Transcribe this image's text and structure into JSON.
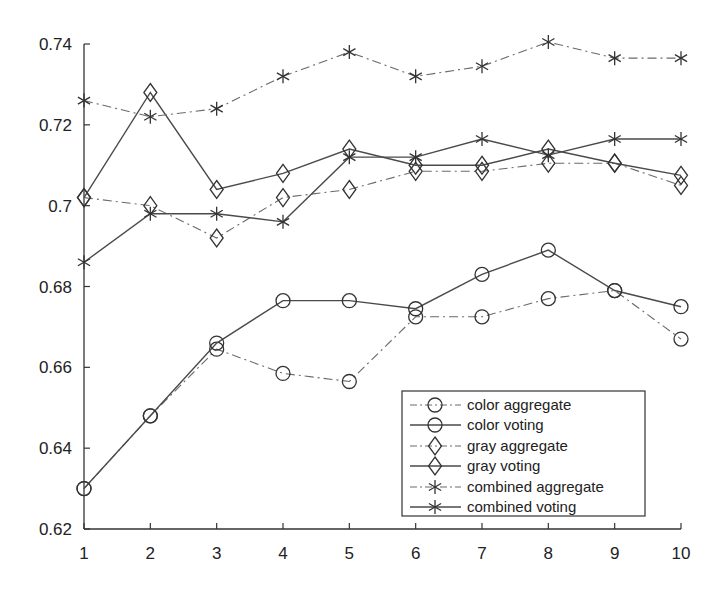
{
  "chart_data": {
    "type": "line",
    "title": "",
    "xlabel": "",
    "ylabel": "",
    "x": [
      1,
      2,
      3,
      4,
      5,
      6,
      7,
      8,
      9,
      10
    ],
    "xlim": [
      1,
      10
    ],
    "ylim": [
      0.62,
      0.74
    ],
    "xticks": [
      "1",
      "2",
      "3",
      "4",
      "5",
      "6",
      "7",
      "8",
      "9",
      "10"
    ],
    "yticks": [
      "0.62",
      "0.64",
      "0.66",
      "0.68",
      "0.7",
      "0.72",
      "0.74"
    ],
    "grid": false,
    "legend_position": "lower right",
    "series": [
      {
        "name": "color aggregate",
        "linestyle": "dash-dot",
        "marker": "circle",
        "values": [
          0.63,
          0.648,
          0.6645,
          0.6585,
          0.6565,
          0.6725,
          0.6725,
          0.677,
          0.679,
          0.667
        ]
      },
      {
        "name": "color voting",
        "linestyle": "solid",
        "marker": "circle",
        "values": [
          0.63,
          0.648,
          0.666,
          0.6765,
          0.6765,
          0.6745,
          0.683,
          0.689,
          0.679,
          0.675
        ]
      },
      {
        "name": "gray aggregate",
        "linestyle": "dash-dot",
        "marker": "diamond",
        "values": [
          0.702,
          0.7,
          0.692,
          0.702,
          0.704,
          0.7085,
          0.7085,
          0.7105,
          0.7105,
          0.705
        ]
      },
      {
        "name": "gray voting",
        "linestyle": "solid",
        "marker": "diamond",
        "values": [
          0.702,
          0.728,
          0.704,
          0.708,
          0.714,
          0.71,
          0.71,
          0.714,
          0.7105,
          0.7075
        ]
      },
      {
        "name": "combined aggregate",
        "linestyle": "dash-dot",
        "marker": "asterisk",
        "values": [
          0.726,
          0.722,
          0.724,
          0.732,
          0.738,
          0.732,
          0.7345,
          0.7405,
          0.7365,
          0.7365
        ]
      },
      {
        "name": "combined voting",
        "linestyle": "solid",
        "marker": "asterisk",
        "values": [
          0.686,
          0.698,
          0.698,
          0.696,
          0.712,
          0.712,
          0.7165,
          0.7125,
          0.7165,
          0.7165
        ]
      }
    ]
  },
  "colors": {
    "line": "#4a4a4a",
    "dashed_line": "#6a6a6a",
    "axis": "#333333",
    "background": "#ffffff"
  },
  "legend": {
    "items": [
      {
        "label": "color aggregate"
      },
      {
        "label": "color voting"
      },
      {
        "label": "gray aggregate"
      },
      {
        "label": "gray voting"
      },
      {
        "label": "combined aggregate"
      },
      {
        "label": "combined voting"
      }
    ]
  }
}
